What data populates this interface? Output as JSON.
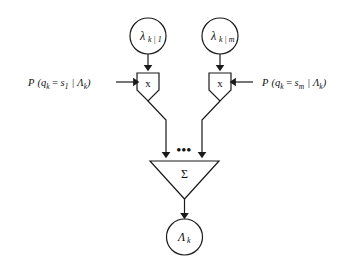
{
  "diagram": {
    "background_color": "#ffffff",
    "stroke_color": "#1a1a1a",
    "text_color": "#111111",
    "input_nodes": [
      {
        "id": "lambda-k-1",
        "symbol": "λ",
        "subscript": "k | 1"
      },
      {
        "id": "lambda-k-m",
        "symbol": "λ",
        "subscript": "k | m"
      }
    ],
    "weight_labels": [
      {
        "id": "prob-s1",
        "prefix": "P",
        "open": "(",
        "variable": "q",
        "var_sub": "k",
        "equals": "=",
        "state": "s",
        "state_sub": "1",
        "bar": "|",
        "condition": "Λ",
        "condition_sub": "k",
        "close": ")",
        "full_text": "P (qₖ = s₁ | Λₖ)"
      },
      {
        "id": "prob-sm",
        "prefix": "P",
        "open": "(",
        "variable": "q",
        "var_sub": "k",
        "equals": "=",
        "state": "s",
        "state_sub": "m",
        "bar": "|",
        "condition": "Λ",
        "condition_sub": "k",
        "close": ")",
        "full_text": "P (qₖ = sₘ | Λₖ)"
      }
    ],
    "multipliers": [
      {
        "id": "multiplier-left",
        "label": "x"
      },
      {
        "id": "multiplier-right",
        "label": "x"
      }
    ],
    "ellipsis": "•••",
    "summation": {
      "id": "summation-node",
      "label": "Σ"
    },
    "output_node": {
      "id": "lambda-k-out",
      "symbol": "Λ",
      "subscript": "k"
    }
  }
}
